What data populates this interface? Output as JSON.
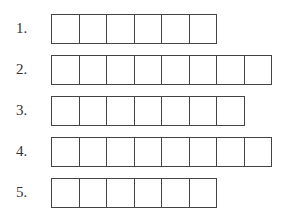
{
  "rows": [
    {
      "label": "1.",
      "boxes": 6,
      "top": 14
    },
    {
      "label": "2.",
      "boxes": 8,
      "top": 55
    },
    {
      "label": "3.",
      "boxes": 7,
      "top": 96
    },
    {
      "label": "4.",
      "boxes": 8,
      "top": 137
    },
    {
      "label": "5.",
      "boxes": 6,
      "top": 178
    }
  ]
}
